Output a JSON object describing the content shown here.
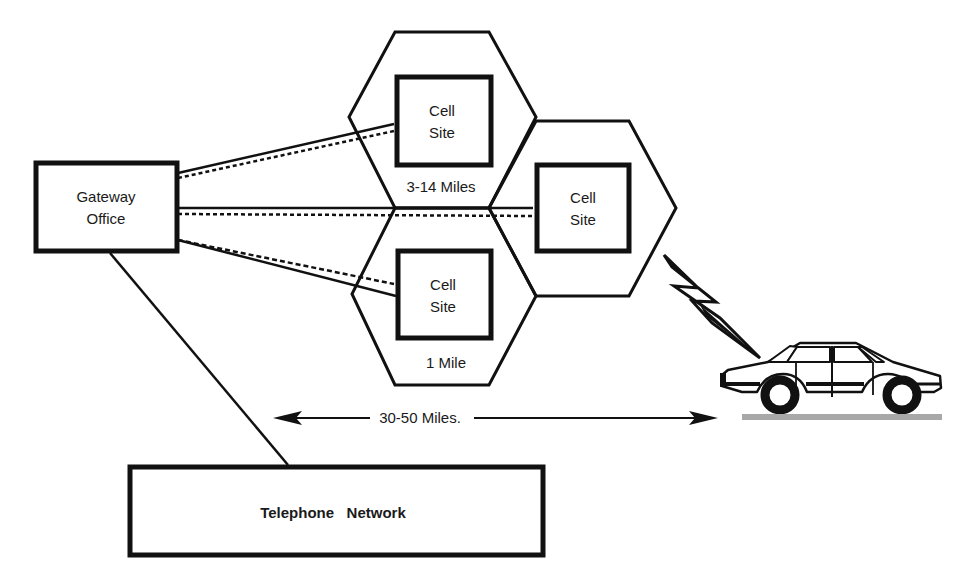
{
  "diagram": {
    "gateway": {
      "line1": "Gateway",
      "line2": "Office"
    },
    "cells": [
      {
        "line1": "Cell",
        "line2": "Site"
      },
      {
        "line1": "Cell",
        "line2": "Site"
      },
      {
        "line1": "Cell",
        "line2": "Site"
      }
    ],
    "cell_radius_label": "3-14 Miles",
    "cell_min_label": "1 Mile",
    "range_label": "30-50 Miles.",
    "network_label": "Telephone   Network",
    "icons": {
      "radio_link": "lightning-bolt-icon",
      "mobile": "car-icon"
    },
    "colors": {
      "ink": "#111111",
      "background": "#ffffff",
      "road": "#a8a8a8"
    }
  }
}
